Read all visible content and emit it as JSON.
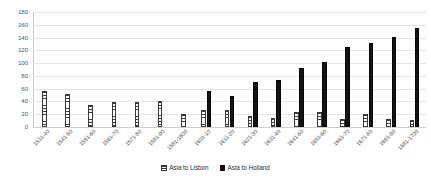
{
  "chart_data": {
    "type": "bar",
    "title": "",
    "subtitle": "",
    "xlabel": "",
    "ylabel": "",
    "ylim": [
      0,
      180
    ],
    "y_ticks": [
      0,
      20,
      40,
      60,
      80,
      100,
      120,
      140,
      160,
      180
    ],
    "grid": true,
    "legend_position": "bottom",
    "categories": [
      "1531-40",
      "1541-50",
      "1551-60",
      "1561-70",
      "1571-80",
      "1581-90",
      "1591-1600",
      "1601-10",
      "1611-20",
      "1621-30",
      "1631-40",
      "1641-50",
      "1651-60",
      "1661-70",
      "1671-80",
      "1681-90",
      "1691-1700"
    ],
    "series": [
      {
        "name": "Asia to Lisbon",
        "color": "#ffffff",
        "pattern": "horizontal-hatch",
        "values": [
          56,
          51,
          35,
          39,
          39,
          41,
          21,
          27,
          27,
          18,
          14,
          23,
          23,
          12,
          20,
          13,
          11
        ]
      },
      {
        "name": "Asia to Holland",
        "color": "#111111",
        "pattern": "solid",
        "values": [
          0,
          0,
          0,
          0,
          0,
          0,
          0,
          57,
          48,
          70,
          74,
          92,
          102,
          126,
          132,
          141,
          155
        ]
      }
    ]
  },
  "legend": {
    "items": [
      {
        "label": "Asia to Lisbon"
      },
      {
        "label": "Asia to Holland"
      }
    ]
  }
}
